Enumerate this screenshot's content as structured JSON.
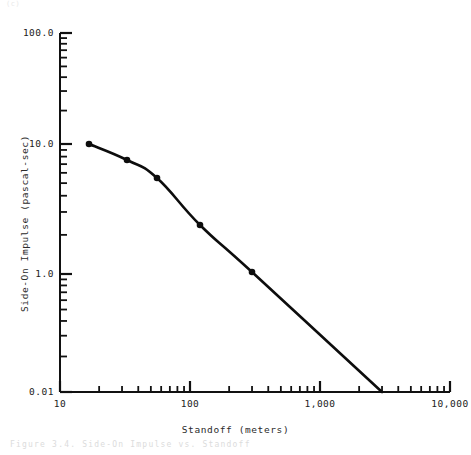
{
  "figure": {
    "top_note": "(c)",
    "caption": "Figure 3.4. Side-On Impulse vs. Standoff"
  },
  "chart_data": {
    "type": "line",
    "title": "",
    "xlabel": "Standoff (meters)",
    "ylabel": "Side-On Impulse (pascal-sec)",
    "xscale": "log",
    "yscale": "log",
    "xlim": [
      10,
      10000
    ],
    "ylim": [
      0.01,
      100.0
    ],
    "grid": false,
    "legend": null,
    "x_ticks": [
      {
        "value": 10,
        "label": "10"
      },
      {
        "value": 100,
        "label": "100"
      },
      {
        "value": 1000,
        "label": "1,000"
      },
      {
        "value": 10000,
        "label": "10,000"
      }
    ],
    "y_ticks": [
      {
        "value": 100.0,
        "label": "100.0"
      },
      {
        "value": 10.0,
        "label": "10.0"
      },
      {
        "value": 1.0,
        "label": "1.0"
      },
      {
        "value": 0.01,
        "label": "0.01"
      }
    ],
    "series": [
      {
        "name": "Side-On Impulse",
        "marker": "filled-circle",
        "x": [
          18,
          32,
          52,
          120,
          300,
          3000
        ],
        "y": [
          10.8,
          8.4,
          6.1,
          2.5,
          1.05,
          0.013
        ],
        "points_px": [
          [
            89,
            144
          ],
          [
            127,
            160
          ],
          [
            157,
            178
          ],
          [
            200,
            225
          ],
          [
            252,
            272
          ],
          [
            382,
            392
          ]
        ],
        "marker_indices": [
          0,
          1,
          2,
          3,
          4
        ]
      }
    ]
  },
  "axes_geometry": {
    "plot_left_px": 60,
    "plot_right_px": 450,
    "plot_top_px": 33,
    "plot_bottom_px": 392,
    "y_tick_px": {
      "100.0": 33,
      "10.0": 144,
      "1.0": 274,
      "0.01": 392
    },
    "x_tick_px": {
      "10": 60,
      "100": 190,
      "1,000": 320,
      "10,000": 450
    }
  }
}
